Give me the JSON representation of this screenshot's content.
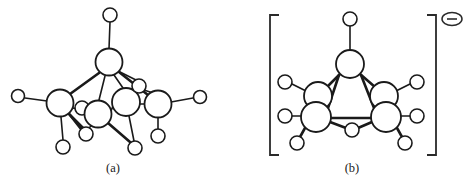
{
  "figure": {
    "background_color": "#ffffff",
    "line_color": "#1a1a1a",
    "panels": [
      {
        "id": "panel-a",
        "caption": "(a)",
        "caption_x": 113,
        "caption_y": 172,
        "charge": null,
        "brackets": false,
        "atoms": [
          {
            "name": "apex-terminal-hydrogen",
            "x": 110,
            "y": 15,
            "r": 7,
            "size": "small"
          },
          {
            "name": "apex-boron",
            "x": 109,
            "y": 62,
            "r": 13.5,
            "size": "large"
          },
          {
            "name": "left-terminal-hydrogen",
            "x": 18,
            "y": 96,
            "r": 6.5,
            "size": "small"
          },
          {
            "name": "left-boron",
            "x": 60,
            "y": 103,
            "r": 13.5,
            "size": "large"
          },
          {
            "name": "bridge-hydrogen-left",
            "x": 82,
            "y": 108,
            "r": 7,
            "size": "small"
          },
          {
            "name": "front-boron",
            "x": 98,
            "y": 114,
            "r": 13.5,
            "size": "large"
          },
          {
            "name": "center-boron",
            "x": 126,
            "y": 102,
            "r": 14,
            "size": "large"
          },
          {
            "name": "center-terminal-hydrogen",
            "x": 139,
            "y": 86,
            "r": 7,
            "size": "small"
          },
          {
            "name": "right-boron",
            "x": 158,
            "y": 104,
            "r": 13.5,
            "size": "large"
          },
          {
            "name": "right-terminal-hydrogen",
            "x": 200,
            "y": 97,
            "r": 6.5,
            "size": "small"
          },
          {
            "name": "right-lower-hydrogen",
            "x": 158,
            "y": 136,
            "r": 7,
            "size": "small"
          },
          {
            "name": "bottom-left-hydrogen",
            "x": 63,
            "y": 147,
            "r": 7,
            "size": "small"
          },
          {
            "name": "bridge-hydrogen-lower",
            "x": 86,
            "y": 134,
            "r": 7,
            "size": "small"
          },
          {
            "name": "bottom-center-hydrogen",
            "x": 135,
            "y": 148,
            "r": 7,
            "size": "small"
          }
        ],
        "bonds": [
          {
            "name": "bond-apexH-apexB",
            "x1": 110,
            "y1": 22,
            "x2": 109,
            "y2": 49,
            "weight": "thin"
          },
          {
            "name": "bond-apexB-leftB",
            "x1": 99,
            "y1": 73,
            "x2": 70,
            "y2": 94,
            "weight": "thick"
          },
          {
            "name": "bond-apexB-frontB",
            "x1": 105,
            "y1": 76,
            "x2": 99,
            "y2": 100,
            "weight": "thin"
          },
          {
            "name": "bond-apexB-centerB",
            "x1": 114,
            "y1": 75,
            "x2": 123,
            "y2": 88,
            "weight": "thin"
          },
          {
            "name": "bond-apexB-rightB",
            "x1": 119,
            "y1": 72,
            "x2": 148,
            "y2": 95,
            "weight": "thick"
          },
          {
            "name": "bond-apexB-centerH",
            "x1": 118,
            "y1": 71,
            "x2": 136,
            "y2": 80,
            "weight": "thin"
          },
          {
            "name": "bond-leftH-leftB",
            "x1": 25,
            "y1": 98,
            "x2": 47,
            "y2": 101,
            "weight": "thin"
          },
          {
            "name": "bond-leftB-bottomLH",
            "x1": 61,
            "y1": 117,
            "x2": 63,
            "y2": 140,
            "weight": "thin"
          },
          {
            "name": "bond-leftB-bridgeLow",
            "x1": 69,
            "y1": 114,
            "x2": 84,
            "y2": 129,
            "weight": "thick"
          },
          {
            "name": "bond-leftB-frontB",
            "x1": 73,
            "y1": 108,
            "x2": 85,
            "y2": 111,
            "weight": "thin"
          },
          {
            "name": "bond-bridgeH-frontB",
            "x1": 89,
            "y1": 108,
            "x2": 95,
            "y2": 108,
            "weight": "thin"
          },
          {
            "name": "bond-frontB-centerB",
            "x1": 111,
            "y1": 111,
            "x2": 113,
            "y2": 106,
            "weight": "thin"
          },
          {
            "name": "bond-frontB-bottomC",
            "x1": 108,
            "y1": 123,
            "x2": 130,
            "y2": 142,
            "weight": "thick"
          },
          {
            "name": "bond-frontB-bridgeLow",
            "x1": 91,
            "y1": 126,
            "x2": 88,
            "y2": 129,
            "weight": "thin"
          },
          {
            "name": "bond-centerB-rightB",
            "x1": 139,
            "y1": 104,
            "x2": 145,
            "y2": 104,
            "weight": "thin"
          },
          {
            "name": "bond-centerB-bottomC",
            "x1": 129,
            "y1": 116,
            "x2": 134,
            "y2": 141,
            "weight": "thin"
          },
          {
            "name": "bond-centerH-rightB",
            "x1": 144,
            "y1": 90,
            "x2": 153,
            "y2": 93,
            "weight": "thin"
          },
          {
            "name": "bond-rightB-rightH",
            "x1": 171,
            "y1": 102,
            "x2": 193,
            "y2": 98,
            "weight": "thin"
          },
          {
            "name": "bond-rightB-lowerH",
            "x1": 158,
            "y1": 118,
            "x2": 158,
            "y2": 129,
            "weight": "thin"
          },
          {
            "name": "bond-leftB-lowerBridge",
            "x1": 70,
            "y1": 115,
            "x2": 81,
            "y2": 129,
            "weight": "thick"
          }
        ]
      },
      {
        "id": "panel-b",
        "caption": "(b)",
        "caption_x": 352,
        "caption_y": 172,
        "charge": "minus",
        "brackets": true,
        "bracket_left_x": 270,
        "bracket_right_x": 436,
        "bracket_top_y": 15,
        "bracket_bottom_y": 155,
        "bracket_arm": 9,
        "charge_x": 452,
        "charge_y": 19,
        "charge_rx": 10,
        "charge_ry": 6.5,
        "atoms": [
          {
            "name": "apex-terminal-hydrogen",
            "x": 350,
            "y": 19,
            "r": 7,
            "size": "small"
          },
          {
            "name": "apex-boron",
            "x": 350,
            "y": 64,
            "r": 14,
            "size": "large"
          },
          {
            "name": "left-upper-terminal-hydrogen",
            "x": 285,
            "y": 82,
            "r": 7,
            "size": "small"
          },
          {
            "name": "left-upper-boron",
            "x": 318,
            "y": 96,
            "r": 14,
            "size": "large"
          },
          {
            "name": "left-lower-terminal-hydrogen",
            "x": 285,
            "y": 116,
            "r": 7,
            "size": "small"
          },
          {
            "name": "left-lower-boron",
            "x": 316,
            "y": 117,
            "r": 15,
            "size": "large"
          },
          {
            "name": "left-axial-hydrogen",
            "x": 297,
            "y": 143,
            "r": 7,
            "size": "small"
          },
          {
            "name": "bridge-bottom-hydrogen",
            "x": 352,
            "y": 130,
            "r": 7,
            "size": "small"
          },
          {
            "name": "right-upper-terminal-hydrogen",
            "x": 417,
            "y": 82,
            "r": 7,
            "size": "small"
          },
          {
            "name": "right-upper-boron",
            "x": 384,
            "y": 96,
            "r": 14,
            "size": "large"
          },
          {
            "name": "right-lower-terminal-hydrogen",
            "x": 417,
            "y": 116,
            "r": 7,
            "size": "small"
          },
          {
            "name": "right-lower-boron",
            "x": 386,
            "y": 117,
            "r": 15,
            "size": "large"
          },
          {
            "name": "right-axial-hydrogen",
            "x": 405,
            "y": 143,
            "r": 7,
            "size": "small"
          }
        ],
        "bonds": [
          {
            "name": "bond-apexH-apexB",
            "x1": 350,
            "y1": 26,
            "x2": 350,
            "y2": 50,
            "weight": "thin"
          },
          {
            "name": "bond-apexB-leftUpperB",
            "x1": 340,
            "y1": 74,
            "x2": 327,
            "y2": 87,
            "weight": "thick"
          },
          {
            "name": "bond-apexB-leftLowerB",
            "x1": 339,
            "y1": 75,
            "x2": 328,
            "y2": 108,
            "weight": "thick"
          },
          {
            "name": "bond-apexB-rightUpperB",
            "x1": 360,
            "y1": 74,
            "x2": 375,
            "y2": 87,
            "weight": "thick"
          },
          {
            "name": "bond-apexB-rightLowerB",
            "x1": 361,
            "y1": 75,
            "x2": 374,
            "y2": 108,
            "weight": "thick"
          },
          {
            "name": "bond-leftUpperH-leftUpperB",
            "x1": 292,
            "y1": 84,
            "x2": 306,
            "y2": 91,
            "weight": "thin"
          },
          {
            "name": "bond-leftLowerH-leftLowerB",
            "x1": 292,
            "y1": 116,
            "x2": 301,
            "y2": 116,
            "weight": "thin"
          },
          {
            "name": "bond-leftLowerB-axialH",
            "x1": 305,
            "y1": 128,
            "x2": 300,
            "y2": 137,
            "weight": "thick"
          },
          {
            "name": "bond-leftLowerB-bridgeH",
            "x1": 330,
            "y1": 122,
            "x2": 346,
            "y2": 128,
            "weight": "thick"
          },
          {
            "name": "bond-leftLowerB-rightLowerB",
            "x1": 331,
            "y1": 118,
            "x2": 371,
            "y2": 118,
            "weight": "thick"
          },
          {
            "name": "bond-rightUpperH-rightUpperB",
            "x1": 410,
            "y1": 84,
            "x2": 396,
            "y2": 91,
            "weight": "thin"
          },
          {
            "name": "bond-rightLowerH-rightLowerB",
            "x1": 410,
            "y1": 116,
            "x2": 401,
            "y2": 116,
            "weight": "thin"
          },
          {
            "name": "bond-rightLowerB-axialH",
            "x1": 397,
            "y1": 128,
            "x2": 402,
            "y2": 137,
            "weight": "thick"
          },
          {
            "name": "bond-rightLowerB-bridgeH",
            "x1": 372,
            "y1": 122,
            "x2": 358,
            "y2": 128,
            "weight": "thick"
          }
        ]
      }
    ]
  }
}
